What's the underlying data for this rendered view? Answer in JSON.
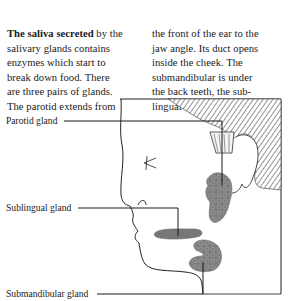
{
  "text": {
    "left_column": {
      "lead_bold": "The saliva secreted",
      "lines": [
        " by the",
        "salivary glands contains",
        "enzymes which start to",
        "break down food. There",
        "are three pairs of glands.",
        "The parotid extends from"
      ]
    },
    "right_column": {
      "lines": [
        "the front of the ear to the",
        "jaw angle. Its duct opens",
        "inside the cheek. The",
        "submandibular is under",
        "the back teeth, the sub-",
        "lingual in the mouth floor."
      ]
    }
  },
  "labels": {
    "parotid": "Parotid gland",
    "sublingual": "Sublingual gland",
    "submandibular": "Submandibular gland"
  },
  "colors": {
    "line": "#1a1a1a",
    "gland_fill": "#7a7a7a",
    "gland_texture": "#5e5e5e",
    "hatch": "#444444",
    "frame": "#333333"
  }
}
